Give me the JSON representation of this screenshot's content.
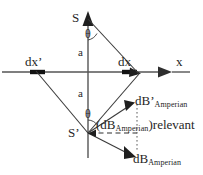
{
  "figure": {
    "labels": {
      "source_top": "S",
      "source_bottom": "S’",
      "angle_top": "θ",
      "angle_bottom": "θ",
      "distance_top": "a",
      "distance_bottom": "a",
      "element_left": "dx’",
      "element_right": "dx",
      "axis_x": "x",
      "field_prime_main": "dB’",
      "field_prime_sub": "Amperian",
      "field_relevant_open": "(dB",
      "field_relevant_sub": "Amperian",
      "field_relevant_close": ")relevant",
      "field_main": "dB",
      "field_sub": "Amperian"
    },
    "colors": {
      "stroke": "#3a3a3a",
      "axis": "#555555",
      "text": "#262626",
      "background": "#ffffff"
    }
  }
}
